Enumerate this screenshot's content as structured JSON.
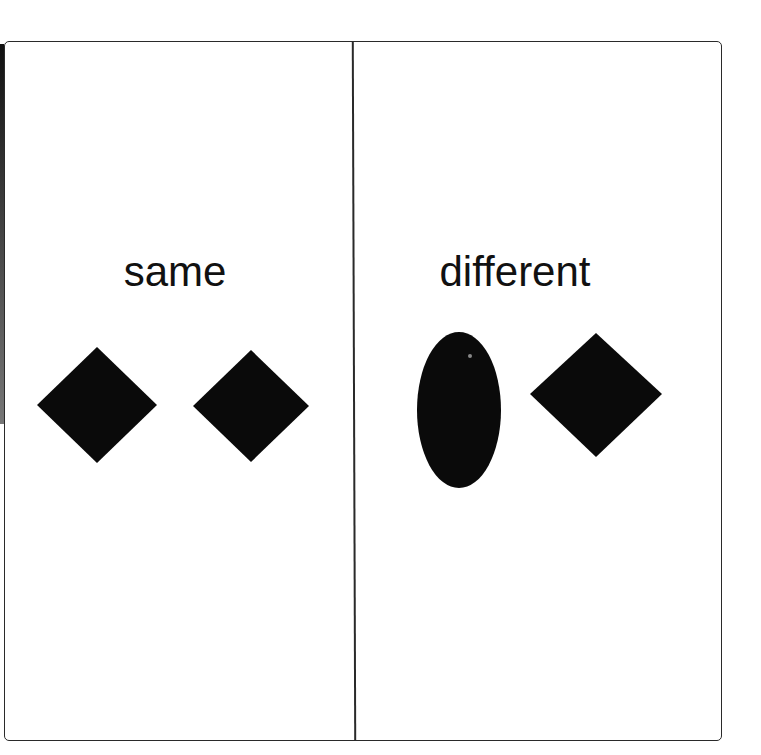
{
  "panels": [
    {
      "label": "same",
      "shapes": [
        {
          "type": "diamond",
          "cx": 97,
          "cy": 405,
          "rx": 60,
          "ry": 58
        },
        {
          "type": "diamond",
          "cx": 251,
          "cy": 406,
          "rx": 58,
          "ry": 56
        }
      ]
    },
    {
      "label": "different",
      "shapes": [
        {
          "type": "ellipse",
          "cx": 459,
          "cy": 410,
          "rx": 42,
          "ry": 78
        },
        {
          "type": "diamond",
          "cx": 596,
          "cy": 394,
          "rx": 66,
          "ry": 62
        }
      ]
    }
  ],
  "colors": {
    "shape": "#0a0a0a",
    "border": "#2a2a2a",
    "text": "#111111"
  }
}
